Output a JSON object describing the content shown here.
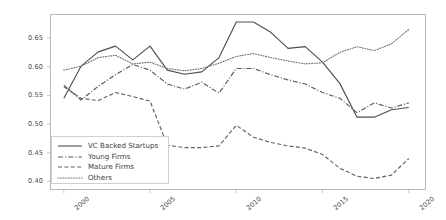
{
  "chart_data": {
    "type": "line",
    "title": "",
    "xlabel": "",
    "ylabel": "",
    "grid": false,
    "legend_position": "lower left",
    "xlim": [
      1999.2,
      2021.0
    ],
    "ylim": [
      0.385,
      0.692
    ],
    "x": [
      2000,
      2001,
      2002,
      2003,
      2004,
      2005,
      2006,
      2007,
      2008,
      2009,
      2010,
      2011,
      2012,
      2013,
      2014,
      2015,
      2016,
      2017,
      2018,
      2019,
      2020
    ],
    "xticks": [
      2000,
      2005,
      2010,
      2015,
      2020
    ],
    "xtick_labels": [
      "2000",
      "2005",
      "2010",
      "2015",
      "2020"
    ],
    "yticks": [
      0.4,
      0.45,
      0.5,
      0.55,
      0.6,
      0.65
    ],
    "ytick_labels": [
      "0.40",
      "0.45",
      "0.50",
      "0.55",
      "0.60",
      "0.65"
    ],
    "series": [
      {
        "name": "VC Backed Startups",
        "style": "solid",
        "color": "#4f4f4f",
        "values": [
          0.545,
          0.601,
          0.626,
          0.636,
          0.612,
          0.636,
          0.594,
          0.587,
          0.591,
          0.616,
          0.678,
          0.678,
          0.66,
          0.632,
          0.635,
          0.608,
          0.571,
          0.512,
          0.512,
          0.525,
          0.529
        ]
      },
      {
        "name": "Young Firms",
        "style": "dashdot",
        "color": "#5a5a5a",
        "values": [
          0.568,
          0.542,
          0.566,
          0.586,
          0.604,
          0.594,
          0.57,
          0.561,
          0.573,
          0.554,
          0.597,
          0.597,
          0.586,
          0.577,
          0.57,
          0.555,
          0.545,
          0.52,
          0.537,
          0.528,
          0.537
        ]
      },
      {
        "name": "Mature Firms",
        "style": "dashed",
        "color": "#616161",
        "values": [
          0.565,
          0.545,
          0.541,
          0.555,
          0.548,
          0.54,
          0.463,
          0.459,
          0.459,
          0.462,
          0.498,
          0.477,
          0.468,
          0.462,
          0.458,
          0.447,
          0.423,
          0.409,
          0.405,
          0.411,
          0.44
        ]
      },
      {
        "name": "Others",
        "style": "dotted",
        "color": "#707070",
        "values": [
          0.594,
          0.601,
          0.616,
          0.62,
          0.605,
          0.608,
          0.597,
          0.593,
          0.597,
          0.606,
          0.618,
          0.623,
          0.616,
          0.61,
          0.605,
          0.607,
          0.625,
          0.635,
          0.628,
          0.64,
          0.665
        ]
      }
    ]
  },
  "legend": {
    "items": [
      {
        "label": "VC Backed Startups"
      },
      {
        "label": "Young Firms"
      },
      {
        "label": "Mature Firms"
      },
      {
        "label": "Others"
      }
    ]
  }
}
